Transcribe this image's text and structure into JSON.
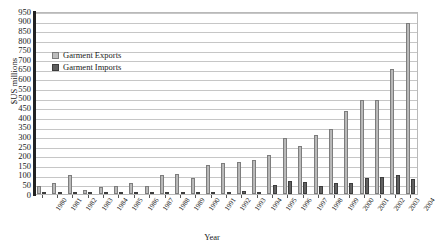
{
  "chart_data": {
    "type": "bar",
    "title": "",
    "xlabel": "Year",
    "ylabel": "$US millions",
    "ylim": [
      0,
      950
    ],
    "ytick_step": 50,
    "grid": true,
    "legend_position": "inside-top-left",
    "categories": [
      "1980",
      "1981",
      "1982",
      "1983",
      "1984",
      "1985",
      "1986",
      "1987",
      "1988",
      "1989",
      "1990",
      "1991",
      "1992",
      "1993",
      "1994",
      "1995",
      "1996",
      "1997",
      "1998",
      "1999",
      "2000",
      "2001",
      "2002",
      "2003",
      "2004"
    ],
    "series": [
      {
        "name": "Garment Exports",
        "color": "#bdbdbd",
        "values": [
          40,
          55,
          100,
          20,
          35,
          40,
          55,
          40,
          100,
          105,
          85,
          150,
          160,
          165,
          175,
          205,
          290,
          250,
          305,
          340,
          430,
          490,
          490,
          650,
          890
        ]
      },
      {
        "name": "Garment Imports",
        "color": "#5f5f5f",
        "values": [
          3,
          3,
          3,
          3,
          3,
          4,
          4,
          4,
          5,
          5,
          5,
          6,
          8,
          14,
          10,
          45,
          70,
          60,
          40,
          55,
          55,
          85,
          90,
          100,
          80
        ]
      }
    ]
  },
  "legend": {
    "items": [
      {
        "label": "Garment Exports",
        "swatch": "exports-swatch"
      },
      {
        "label": "Garment Imports",
        "swatch": "imports-swatch"
      }
    ]
  },
  "axes": {
    "y_title": "$US millions",
    "x_title": "Year",
    "y_ticks": [
      "950",
      "900",
      "850",
      "800",
      "750",
      "700",
      "650",
      "600",
      "550",
      "500",
      "450",
      "400",
      "350",
      "300",
      "250",
      "200",
      "150",
      "100",
      "50",
      "0"
    ]
  }
}
